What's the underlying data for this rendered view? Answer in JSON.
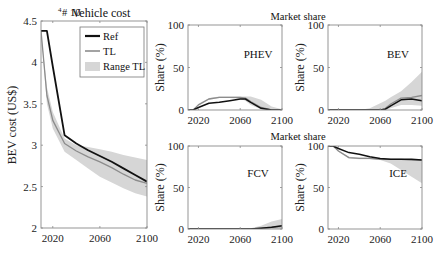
{
  "colors": {
    "ref": "#111111",
    "tl": "#8c8c8c",
    "range": "#d6d6d6",
    "axis": "#8a8a8a"
  },
  "chart_data": [
    {
      "id": "vehicle-cost",
      "type": "line",
      "title": "Vehicle cost",
      "exponent_label": "# 10",
      "exponent_power": "4",
      "xlabel": "",
      "ylabel": "BEV cost (US$)",
      "xlim": [
        2010,
        2100
      ],
      "ylim": [
        2,
        4.5
      ],
      "xticks": [
        2020,
        2060,
        2100
      ],
      "yticks": [
        2,
        2.5,
        3,
        3.5,
        4,
        4.5
      ],
      "ytick_labels": [
        "2",
        "2.5",
        "3",
        "3.5",
        "4",
        "4.5"
      ],
      "legend": {
        "position": "upper right",
        "entries": [
          "Ref",
          "TL",
          "Range TL"
        ]
      },
      "x": [
        2010,
        2015,
        2020,
        2030,
        2040,
        2050,
        2060,
        2070,
        2080,
        2090,
        2100
      ],
      "series": [
        {
          "name": "Ref",
          "values": [
            4.38,
            4.38,
            3.95,
            3.12,
            3.02,
            2.94,
            2.87,
            2.8,
            2.72,
            2.64,
            2.56
          ]
        },
        {
          "name": "TL",
          "values": [
            4.38,
            3.6,
            3.3,
            3.02,
            2.93,
            2.86,
            2.8,
            2.73,
            2.65,
            2.58,
            2.54
          ]
        }
      ],
      "range": {
        "name": "Range TL",
        "upper": [
          4.38,
          3.7,
          3.4,
          3.08,
          3.0,
          2.98,
          2.95,
          2.92,
          2.88,
          2.85,
          2.82
        ],
        "lower": [
          4.38,
          3.5,
          3.2,
          2.92,
          2.82,
          2.72,
          2.62,
          2.55,
          2.48,
          2.42,
          2.38
        ]
      }
    },
    {
      "id": "phev",
      "type": "line",
      "group_title": "Market share",
      "label": "PHEV",
      "ylabel": "Share (%)",
      "xlim": [
        2010,
        2100
      ],
      "ylim": [
        0,
        100
      ],
      "xticks": [
        2020,
        2060,
        2100
      ],
      "yticks": [
        0,
        50,
        100
      ],
      "x": [
        2010,
        2015,
        2020,
        2030,
        2040,
        2050,
        2060,
        2065,
        2070,
        2080,
        2090,
        2100
      ],
      "series": [
        {
          "name": "Ref",
          "values": [
            0,
            0,
            3,
            8,
            9,
            11,
            13,
            13,
            9,
            2,
            0,
            0
          ]
        },
        {
          "name": "TL",
          "values": [
            0,
            0,
            6,
            13,
            15,
            15,
            15,
            14,
            10,
            3,
            0,
            0
          ]
        }
      ],
      "range": {
        "upper": [
          0,
          0,
          7,
          14,
          16,
          16,
          16,
          16,
          16,
          12,
          4,
          1
        ],
        "lower": [
          0,
          0,
          5,
          12,
          14,
          14,
          13,
          11,
          6,
          1,
          0,
          0
        ]
      }
    },
    {
      "id": "bev",
      "type": "line",
      "label": "BEV",
      "ylabel": "Share (%)",
      "xlim": [
        2010,
        2100
      ],
      "ylim": [
        0,
        100
      ],
      "xticks": [
        2020,
        2060,
        2100
      ],
      "yticks": [
        0,
        50,
        100
      ],
      "x": [
        2010,
        2020,
        2040,
        2050,
        2060,
        2065,
        2070,
        2080,
        2090,
        2100
      ],
      "series": [
        {
          "name": "Ref",
          "values": [
            0,
            0,
            0,
            0,
            0,
            1,
            5,
            12,
            13,
            11
          ]
        },
        {
          "name": "TL",
          "values": [
            0,
            0,
            0,
            0,
            0,
            2,
            7,
            14,
            15,
            17
          ]
        }
      ],
      "range": {
        "upper": [
          0,
          0,
          0,
          2,
          8,
          11,
          15,
          22,
          33,
          45
        ],
        "lower": [
          0,
          0,
          0,
          0,
          0,
          0,
          2,
          6,
          6,
          5
        ]
      }
    },
    {
      "id": "fcv",
      "type": "line",
      "group_title": "Market share",
      "label": "FCV",
      "ylabel": "Share (%)",
      "xlim": [
        2010,
        2100
      ],
      "ylim": [
        0,
        100
      ],
      "xticks": [
        2020,
        2060,
        2100
      ],
      "yticks": [
        0,
        50,
        100
      ],
      "x": [
        2010,
        2060,
        2070,
        2080,
        2090,
        2100
      ],
      "series": [
        {
          "name": "Ref",
          "values": [
            0,
            0,
            0,
            1,
            2,
            4
          ]
        },
        {
          "name": "TL",
          "values": [
            0,
            0,
            0,
            1,
            2,
            3
          ]
        }
      ],
      "range": {
        "upper": [
          0,
          0,
          1,
          4,
          9,
          12
        ],
        "lower": [
          0,
          0,
          0,
          0,
          0,
          0
        ]
      }
    },
    {
      "id": "ice",
      "type": "line",
      "label": "ICE",
      "ylabel": "Share (%)",
      "xlim": [
        2010,
        2100
      ],
      "ylim": [
        0,
        100
      ],
      "xticks": [
        2020,
        2060,
        2100
      ],
      "yticks": [
        0,
        50,
        100
      ],
      "x": [
        2010,
        2015,
        2020,
        2030,
        2040,
        2050,
        2060,
        2070,
        2080,
        2090,
        2100
      ],
      "series": [
        {
          "name": "Ref",
          "values": [
            100,
            100,
            97,
            92,
            90,
            87,
            85,
            84,
            84,
            84,
            83
          ]
        },
        {
          "name": "TL",
          "values": [
            100,
            100,
            94,
            86,
            85,
            85,
            84,
            84,
            84,
            83,
            83
          ]
        }
      ],
      "range": {
        "upper": [
          100,
          100,
          95,
          87,
          86,
          86,
          85,
          84,
          84,
          84,
          84
        ],
        "lower": [
          100,
          100,
          93,
          85,
          84,
          84,
          83,
          79,
          71,
          63,
          55
        ]
      }
    }
  ]
}
